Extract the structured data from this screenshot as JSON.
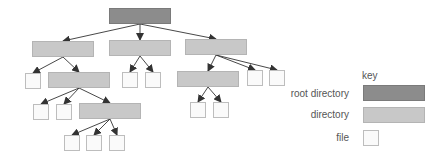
{
  "diagram": {
    "type": "directory-tree",
    "colors": {
      "root": "#8c8c8c",
      "directory": "#c8c8c8",
      "file": "#fafafa",
      "arrow": "#333333"
    },
    "nodes": [
      {
        "id": "root",
        "kind": "root",
        "x": 109,
        "y": 8,
        "w": 62,
        "h": 16
      },
      {
        "id": "d1",
        "kind": "directory",
        "x": 32,
        "y": 41,
        "w": 62,
        "h": 16
      },
      {
        "id": "d2",
        "kind": "directory",
        "x": 109,
        "y": 40,
        "w": 62,
        "h": 16
      },
      {
        "id": "d3",
        "kind": "directory",
        "x": 185,
        "y": 39,
        "w": 62,
        "h": 16
      },
      {
        "id": "f1",
        "kind": "file",
        "x": 25,
        "y": 73,
        "w": 16,
        "h": 16
      },
      {
        "id": "d4",
        "kind": "directory",
        "x": 48,
        "y": 72,
        "w": 62,
        "h": 16
      },
      {
        "id": "f2",
        "kind": "file",
        "x": 122,
        "y": 72,
        "w": 16,
        "h": 16
      },
      {
        "id": "f3",
        "kind": "file",
        "x": 145,
        "y": 72,
        "w": 16,
        "h": 16
      },
      {
        "id": "d5",
        "kind": "directory",
        "x": 177,
        "y": 71,
        "w": 62,
        "h": 16
      },
      {
        "id": "f4",
        "kind": "file",
        "x": 247,
        "y": 70,
        "w": 16,
        "h": 16
      },
      {
        "id": "f5",
        "kind": "file",
        "x": 269,
        "y": 70,
        "w": 16,
        "h": 16
      },
      {
        "id": "f6",
        "kind": "file",
        "x": 33,
        "y": 104,
        "w": 16,
        "h": 16
      },
      {
        "id": "f7",
        "kind": "file",
        "x": 56,
        "y": 104,
        "w": 16,
        "h": 16
      },
      {
        "id": "d6",
        "kind": "directory",
        "x": 79,
        "y": 103,
        "w": 62,
        "h": 16
      },
      {
        "id": "f8",
        "kind": "file",
        "x": 190,
        "y": 102,
        "w": 16,
        "h": 16
      },
      {
        "id": "f9",
        "kind": "file",
        "x": 213,
        "y": 102,
        "w": 16,
        "h": 16
      },
      {
        "id": "f10",
        "kind": "file",
        "x": 64,
        "y": 135,
        "w": 16,
        "h": 16
      },
      {
        "id": "f11",
        "kind": "file",
        "x": 86,
        "y": 135,
        "w": 16,
        "h": 16
      },
      {
        "id": "f12",
        "kind": "file",
        "x": 109,
        "y": 135,
        "w": 16,
        "h": 16
      }
    ],
    "edges": [
      [
        "root",
        "d1"
      ],
      [
        "root",
        "d2"
      ],
      [
        "root",
        "d3"
      ],
      [
        "d1",
        "f1"
      ],
      [
        "d1",
        "d4"
      ],
      [
        "d2",
        "f2"
      ],
      [
        "d2",
        "f3"
      ],
      [
        "d3",
        "d5"
      ],
      [
        "d3",
        "f4"
      ],
      [
        "d3",
        "f5"
      ],
      [
        "d4",
        "f6"
      ],
      [
        "d4",
        "f7"
      ],
      [
        "d4",
        "d6"
      ],
      [
        "d5",
        "f8"
      ],
      [
        "d5",
        "f9"
      ],
      [
        "d6",
        "f10"
      ],
      [
        "d6",
        "f11"
      ],
      [
        "d6",
        "f12"
      ]
    ]
  },
  "key": {
    "title": "key",
    "items": [
      {
        "label": "root directory",
        "kind": "root"
      },
      {
        "label": "directory",
        "kind": "directory"
      },
      {
        "label": "file",
        "kind": "file"
      }
    ]
  }
}
